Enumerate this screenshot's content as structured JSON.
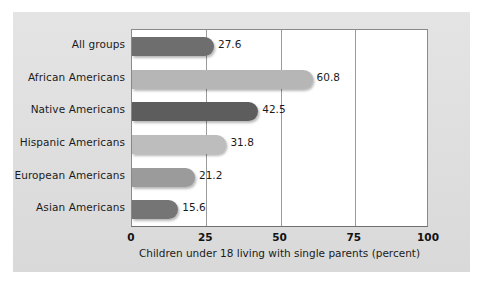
{
  "figure": {
    "background_color": "#e2e2e2",
    "plot_background_color": "#ffffff"
  },
  "chart_data": {
    "type": "bar",
    "orientation": "horizontal",
    "title": "",
    "subtitle": "",
    "xlabel": "Children under 18 living with single parents (percent)",
    "ylabel": "",
    "categories": [
      "All groups",
      "African Americans",
      "Native Americans",
      "Hispanic Americans",
      "European Americans",
      "Asian Americans"
    ],
    "values": [
      27.6,
      60.8,
      42.5,
      31.8,
      21.2,
      15.6
    ],
    "value_labels": [
      "27.6",
      "60.8",
      "42.5",
      "31.8",
      "21.2",
      "15.6"
    ],
    "bar_colors": [
      "#6e6e6e",
      "#b6b6b6",
      "#5d5d5d",
      "#bdbdbd",
      "#9b9b9b",
      "#757575"
    ],
    "xlim": [
      0,
      100
    ],
    "xticks": [
      0,
      25,
      50,
      75,
      100
    ],
    "xtick_labels": [
      "0",
      "25",
      "50",
      "75",
      "100"
    ],
    "grid": true,
    "grid_axis": "x",
    "legend": false,
    "legend_position": "none"
  }
}
